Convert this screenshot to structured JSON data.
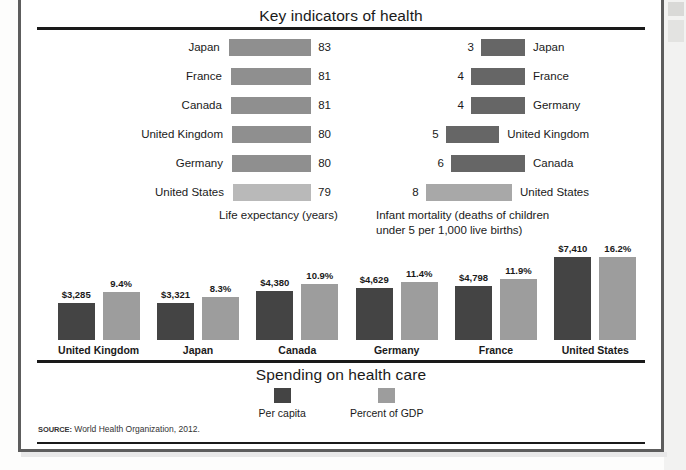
{
  "figure": {
    "title_top": "Key indicators of health",
    "title_bottom": "Spending on health care",
    "source_key": "SOURCE:",
    "source_text": "World Health Organization, 2012."
  },
  "life": {
    "caption": "Life expectancy (years)",
    "rows": [
      {
        "label": "Japan",
        "value": "83",
        "v": 83
      },
      {
        "label": "France",
        "value": "81",
        "v": 81
      },
      {
        "label": "Canada",
        "value": "81",
        "v": 81
      },
      {
        "label": "United Kingdom",
        "value": "80",
        "v": 80
      },
      {
        "label": "Germany",
        "value": "80",
        "v": 80
      },
      {
        "label": "United States",
        "value": "79",
        "v": 79
      }
    ]
  },
  "infant": {
    "caption_line1": "Infant mortality (deaths of children",
    "caption_line2": "under 5 per 1,000 live births)",
    "rows": [
      {
        "label": "Japan",
        "value": "3",
        "v": 3
      },
      {
        "label": "France",
        "value": "4",
        "v": 4
      },
      {
        "label": "Germany",
        "value": "4",
        "v": 4
      },
      {
        "label": "United Kingdom",
        "value": "5",
        "v": 5
      },
      {
        "label": "Canada",
        "value": "6",
        "v": 6
      },
      {
        "label": "United States",
        "value": "8",
        "v": 8
      }
    ]
  },
  "spending": {
    "legend": [
      {
        "label": "Per capita",
        "color": "#444444"
      },
      {
        "label": "Percent of GDP",
        "color": "#9d9d9d"
      }
    ],
    "groups": [
      {
        "label": "United Kingdom",
        "per_capita_label": "$3,285",
        "per_capita": 3285,
        "gdp_label": "9.4%",
        "gdp": 9.4
      },
      {
        "label": "Japan",
        "per_capita_label": "$3,321",
        "per_capita": 3321,
        "gdp_label": "8.3%",
        "gdp": 8.3
      },
      {
        "label": "Canada",
        "per_capita_label": "$4,380",
        "per_capita": 4380,
        "gdp_label": "10.9%",
        "gdp": 10.9
      },
      {
        "label": "Germany",
        "per_capita_label": "$4,629",
        "per_capita": 4629,
        "gdp_label": "11.4%",
        "gdp": 11.4
      },
      {
        "label": "France",
        "per_capita_label": "$4,798",
        "per_capita": 4798,
        "gdp_label": "11.9%",
        "gdp": 11.9
      },
      {
        "label": "United States",
        "per_capita_label": "$7,410",
        "per_capita": 7410,
        "gdp_label": "16.2%",
        "gdp": 16.2
      }
    ]
  },
  "chart_data": [
    {
      "type": "bar",
      "orientation": "horizontal",
      "title": "Life expectancy (years)",
      "categories": [
        "Japan",
        "France",
        "Canada",
        "United Kingdom",
        "Germany",
        "United States"
      ],
      "values": [
        83,
        81,
        81,
        80,
        80,
        79
      ],
      "xlabel": "Years",
      "ylabel": "",
      "xlim": [
        0,
        83
      ],
      "grid": false,
      "legend": "none",
      "note": "Bars share a common left baseline; value labels shown at the right end of each bar. United States bar is rendered in a lighter grey."
    },
    {
      "type": "bar",
      "orientation": "horizontal",
      "title": "Infant mortality (deaths of children under 5 per 1,000 live births)",
      "categories": [
        "Japan",
        "France",
        "Germany",
        "United Kingdom",
        "Canada",
        "United States"
      ],
      "values": [
        3,
        4,
        4,
        5,
        6,
        8
      ],
      "xlabel": "Deaths per 1,000 live births",
      "ylabel": "",
      "xlim": [
        0,
        8
      ],
      "grid": false,
      "legend": "none",
      "note": "Bars are right-anchored and grow leftwards; value labels at the left end, country labels at the right. United States bar is rendered in a lighter grey."
    },
    {
      "type": "bar",
      "orientation": "vertical",
      "title": "Spending on health care",
      "categories": [
        "United Kingdom",
        "Japan",
        "Canada",
        "Germany",
        "France",
        "United States"
      ],
      "series": [
        {
          "name": "Per capita",
          "values": [
            3285,
            3321,
            4380,
            4629,
            4798,
            7410
          ],
          "color": "#444444",
          "unit": "USD"
        },
        {
          "name": "Percent of GDP",
          "values": [
            9.4,
            8.3,
            10.9,
            11.4,
            11.9,
            16.2
          ],
          "color": "#9d9d9d",
          "unit": "%"
        }
      ],
      "xlabel": "",
      "ylabel": "",
      "grid": false,
      "legend": "bottom-center",
      "note": "Grouped pairs; each bar is annotated with its value above the column."
    }
  ]
}
